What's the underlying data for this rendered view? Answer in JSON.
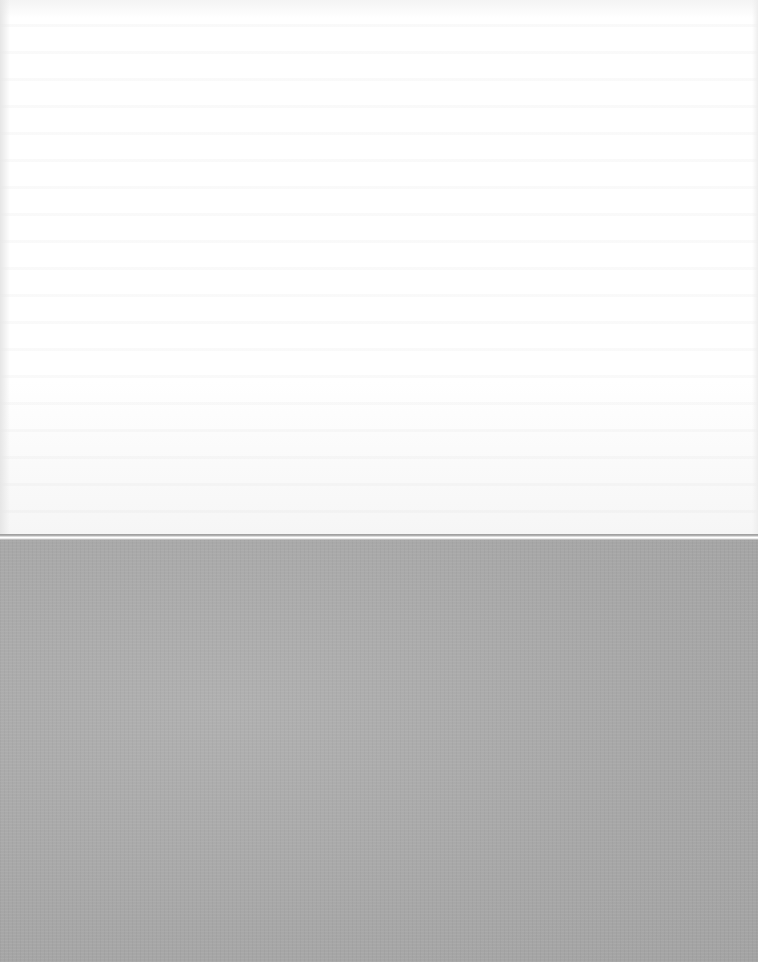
{
  "document": {
    "page_text": "",
    "colors": {
      "paper": "#ffffff",
      "backing": "#a9a9a9"
    }
  }
}
